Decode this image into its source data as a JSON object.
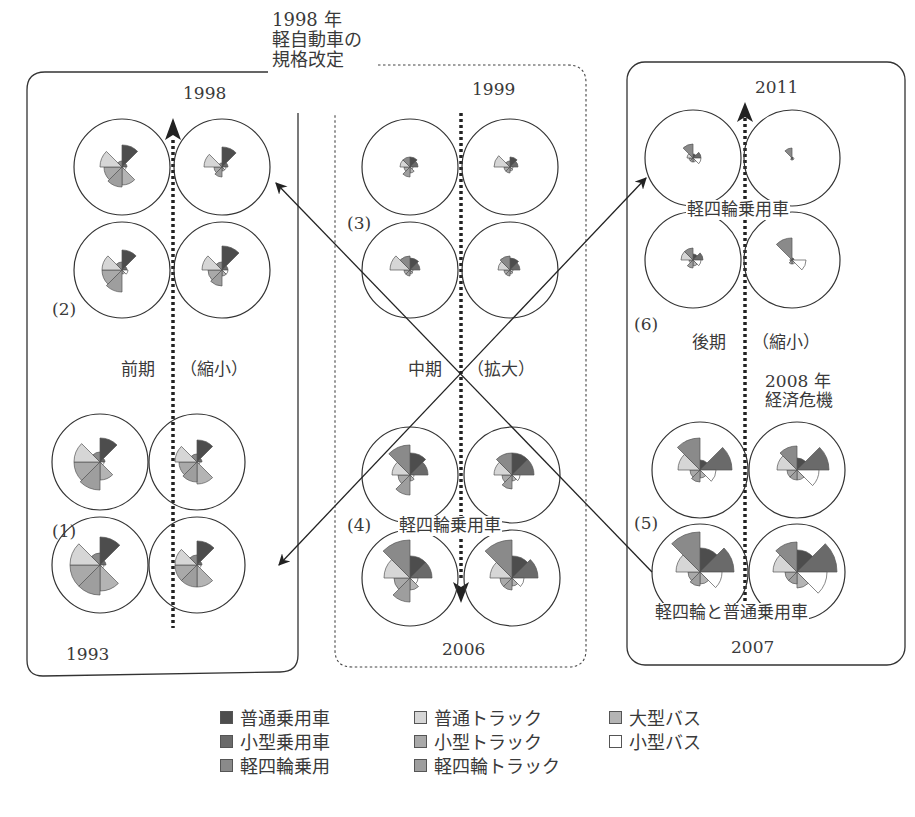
{
  "annotations": {
    "kei_revision": [
      "1998 年",
      "軽自動車の",
      "規格改定"
    ],
    "crisis": [
      "2008 年",
      "経済危機"
    ],
    "kei_passenger_a": "軽四輪乗用車",
    "kei_passenger_b": "軽四輪乗用車",
    "kei_and_regular": "軽四輪と普通乗用車"
  },
  "panels": [
    {
      "id": "early",
      "period": "前期",
      "change": "（縮小）",
      "top_year": "1998",
      "bottom_year": "1993",
      "groups": [
        "(2)",
        "(1)"
      ]
    },
    {
      "id": "middle",
      "period": "中期",
      "change": "（拡大）",
      "top_year": "1999",
      "bottom_year": "2006",
      "groups": [
        "(3)",
        "(4)"
      ]
    },
    {
      "id": "late",
      "period": "後期",
      "change": "（縮小）",
      "top_year": "2011",
      "bottom_year": "2007",
      "groups": [
        "(6)",
        "(5)"
      ]
    }
  ],
  "legend": [
    {
      "label": "普通乗用車",
      "color": "#4d4d4d"
    },
    {
      "label": "普通トラック",
      "color": "#d6d6d6"
    },
    {
      "label": "大型バス",
      "color": "#b4b4b4"
    },
    {
      "label": "小型乗用車",
      "color": "#6a6a6a"
    },
    {
      "label": "小型トラック",
      "color": "#a9a9a9"
    },
    {
      "label": "小型バス",
      "color": "#ffffff"
    },
    {
      "label": "軽四輪乗用",
      "color": "#8a8a8a"
    },
    {
      "label": "軽四輪トラック",
      "color": "#9e9e9e"
    }
  ],
  "chart_data": {
    "type": "rose",
    "title": "",
    "sector_order_clockwise_from_top": [
      "普通乗用車",
      "小型乗用車",
      "小型バス",
      "大型バス",
      "軽四輪トラック",
      "小型トラック",
      "普通トラック",
      "軽四輪乗用"
    ],
    "sector_colors": [
      "#4d4d4d",
      "#6a6a6a",
      "#ffffff",
      "#b4b4b4",
      "#9e9e9e",
      "#a9a9a9",
      "#d6d6d6",
      "#8a8a8a"
    ],
    "unit": "relative radius (px, approx.)",
    "roses": [
      {
        "group": "(1)",
        "pos": "bottom-left",
        "year": "1993",
        "values": [
          28,
          6,
          4,
          26,
          30,
          30,
          30,
          12
        ]
      },
      {
        "group": "(1)",
        "pos": "bottom-right",
        "year": "1994",
        "values": [
          24,
          5,
          4,
          22,
          22,
          22,
          22,
          10
        ]
      },
      {
        "group": "(1)",
        "pos": "top-left",
        "year": "1995",
        "values": [
          24,
          5,
          4,
          18,
          28,
          26,
          26,
          10
        ]
      },
      {
        "group": "(1)",
        "pos": "top-right",
        "year": "1996",
        "values": [
          22,
          5,
          3,
          22,
          20,
          18,
          22,
          8
        ]
      },
      {
        "group": "(2)",
        "pos": "bottom-left",
        "year": "1997",
        "values": [
          20,
          5,
          6,
          4,
          22,
          20,
          20,
          8
        ]
      },
      {
        "group": "(2)",
        "pos": "bottom-right",
        "year": "1997b",
        "values": [
          24,
          6,
          6,
          6,
          16,
          14,
          20,
          8
        ]
      },
      {
        "group": "(2)",
        "pos": "top-left",
        "year": "1998a",
        "values": [
          22,
          5,
          4,
          18,
          20,
          18,
          22,
          6
        ]
      },
      {
        "group": "(2)",
        "pos": "top-right",
        "year": "1998",
        "values": [
          20,
          6,
          4,
          4,
          10,
          8,
          18,
          4
        ]
      },
      {
        "group": "(3)",
        "pos": "top-left",
        "year": "1999",
        "values": [
          10,
          8,
          3,
          6,
          10,
          6,
          10,
          10
        ]
      },
      {
        "group": "(3)",
        "pos": "top-right",
        "year": "2000",
        "values": [
          10,
          8,
          3,
          4,
          6,
          6,
          16,
          6
        ]
      },
      {
        "group": "(3)",
        "pos": "bottom-left",
        "year": "2001",
        "values": [
          12,
          10,
          3,
          4,
          6,
          6,
          20,
          14
        ]
      },
      {
        "group": "(3)",
        "pos": "bottom-right",
        "year": "2002",
        "values": [
          12,
          10,
          3,
          4,
          6,
          6,
          12,
          14
        ]
      },
      {
        "group": "(4)",
        "pos": "top-left",
        "year": "2003",
        "values": [
          22,
          18,
          4,
          6,
          20,
          12,
          18,
          30
        ]
      },
      {
        "group": "(4)",
        "pos": "top-right",
        "year": "2004",
        "values": [
          22,
          22,
          8,
          6,
          14,
          10,
          18,
          22
        ]
      },
      {
        "group": "(4)",
        "pos": "bottom-left",
        "year": "2005",
        "values": [
          22,
          22,
          8,
          12,
          24,
          16,
          26,
          38
        ]
      },
      {
        "group": "(4)",
        "pos": "bottom-right",
        "year": "2006",
        "values": [
          22,
          26,
          12,
          8,
          12,
          12,
          22,
          38
        ]
      },
      {
        "group": "(5)",
        "pos": "bottom-left",
        "year": "2007",
        "values": [
          24,
          34,
          22,
          12,
          14,
          12,
          24,
          40
        ]
      },
      {
        "group": "(5)",
        "pos": "bottom-right",
        "year": "2007b",
        "values": [
          22,
          40,
          30,
          16,
          12,
          12,
          24,
          30
        ]
      },
      {
        "group": "(5)",
        "pos": "top-left",
        "year": "2008",
        "values": [
          10,
          32,
          16,
          8,
          12,
          10,
          22,
          32
        ]
      },
      {
        "group": "(5)",
        "pos": "top-right",
        "year": "2009",
        "values": [
          12,
          32,
          22,
          10,
          10,
          10,
          20,
          24
        ]
      },
      {
        "group": "(6)",
        "pos": "bottom-left",
        "year": "2009b",
        "values": [
          6,
          10,
          8,
          6,
          8,
          4,
          12,
          12
        ]
      },
      {
        "group": "(6)",
        "pos": "bottom-right",
        "year": "2010",
        "values": [
          2,
          2,
          14,
          4,
          4,
          2,
          2,
          22
        ]
      },
      {
        "group": "(6)",
        "pos": "top-left",
        "year": "2010b",
        "values": [
          4,
          8,
          8,
          4,
          4,
          4,
          6,
          14
        ]
      },
      {
        "group": "(6)",
        "pos": "top-right",
        "year": "2011",
        "values": [
          1,
          1,
          2,
          2,
          2,
          1,
          1,
          10
        ]
      }
    ]
  }
}
